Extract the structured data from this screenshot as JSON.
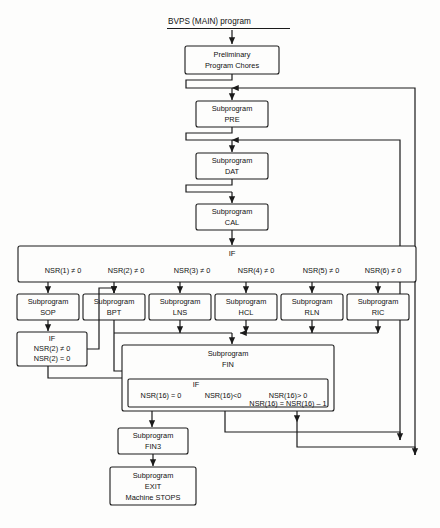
{
  "diagram": {
    "title": "BVPS (MAIN) program",
    "nodes": {
      "prelim": {
        "line1": "Preliminary",
        "line2": "Program Chores"
      },
      "pre": {
        "line1": "Subprogram",
        "line2": "PRE"
      },
      "dat": {
        "line1": "Subprogram",
        "line2": "DAT"
      },
      "cal": {
        "line1": "Subprogram",
        "line2": "CAL"
      },
      "sop": {
        "line1": "Subprogram",
        "line2": "SOP"
      },
      "bpt": {
        "line1": "Subprogram",
        "line2": "BPT"
      },
      "lns": {
        "line1": "Subprogram",
        "line2": "LNS"
      },
      "hcl": {
        "line1": "Subprogram",
        "line2": "HCL"
      },
      "rln": {
        "line1": "Subprogram",
        "line2": "RLN"
      },
      "ric": {
        "line1": "Subprogram",
        "line2": "RIC"
      },
      "fin": {
        "line1": "Subprogram",
        "line2": "FIN"
      },
      "fin3": {
        "line1": "Subprogram",
        "line2": "FIN3"
      },
      "exit": {
        "line1": "Subprogram",
        "line2": "EXIT",
        "line3": "Machine STOPS"
      }
    },
    "main_if": {
      "keyword": "IF",
      "conditions": [
        "NSR(1) ≠ 0",
        "NSR(2) ≠ 0",
        "NSR(3) ≠ 0",
        "NSR(4) ≠ 0",
        "NSR(5) ≠ 0",
        "NSR(6) ≠ 0"
      ]
    },
    "sop_if": {
      "keyword": "IF",
      "conditions": [
        "NSR(2) ≠ 0",
        "NSR(2) = 0"
      ]
    },
    "fin_if": {
      "keyword": "IF",
      "conditions": [
        "NSR(16) = 0",
        "NSR(16)<0",
        "NSR(16)> 0"
      ],
      "assignment": "NSR(16) = NSR(16) – 1"
    }
  }
}
